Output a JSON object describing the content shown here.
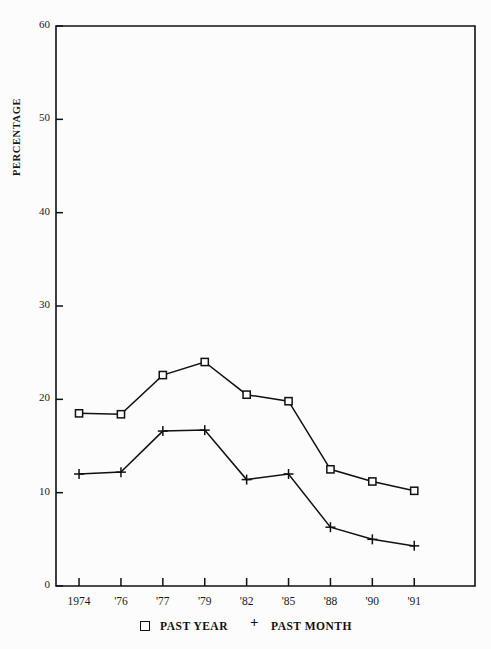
{
  "chart_data": {
    "type": "line",
    "title": "",
    "subtitle": "",
    "xlabel": "",
    "ylabel": "PERCENTAGE",
    "categories": [
      "1974",
      "'76",
      "'77",
      "'79",
      "'82",
      "'85",
      "'88",
      "'90",
      "'91"
    ],
    "x_tick_labels": [
      "1974",
      "'76",
      "'77",
      "'79",
      "'82",
      "'85",
      "'88",
      "'90",
      "'91"
    ],
    "y_tick_labels": [
      "0",
      "10",
      "20",
      "30",
      "40",
      "50",
      "60"
    ],
    "y_ticks": [
      0,
      10,
      20,
      30,
      40,
      50,
      60
    ],
    "ylim": [
      0,
      60
    ],
    "grid": false,
    "legend_position": "bottom",
    "series": [
      {
        "name": "PAST YEAR",
        "marker": "square",
        "color": "#111111",
        "values": [
          18.5,
          18.4,
          22.6,
          24.0,
          20.5,
          19.8,
          12.5,
          11.2,
          10.2
        ]
      },
      {
        "name": "PAST MONTH",
        "marker": "plus",
        "color": "#111111",
        "values": [
          12.0,
          12.2,
          16.6,
          16.7,
          11.4,
          12.0,
          6.3,
          5.0,
          4.3
        ]
      }
    ]
  },
  "legend": {
    "entries": [
      {
        "label": "PAST YEAR",
        "marker": "square"
      },
      {
        "label": "PAST MONTH",
        "marker": "plus"
      }
    ]
  },
  "colors": {
    "background": "#fcfcfc",
    "axis": "#111111",
    "ink": "#111111"
  }
}
